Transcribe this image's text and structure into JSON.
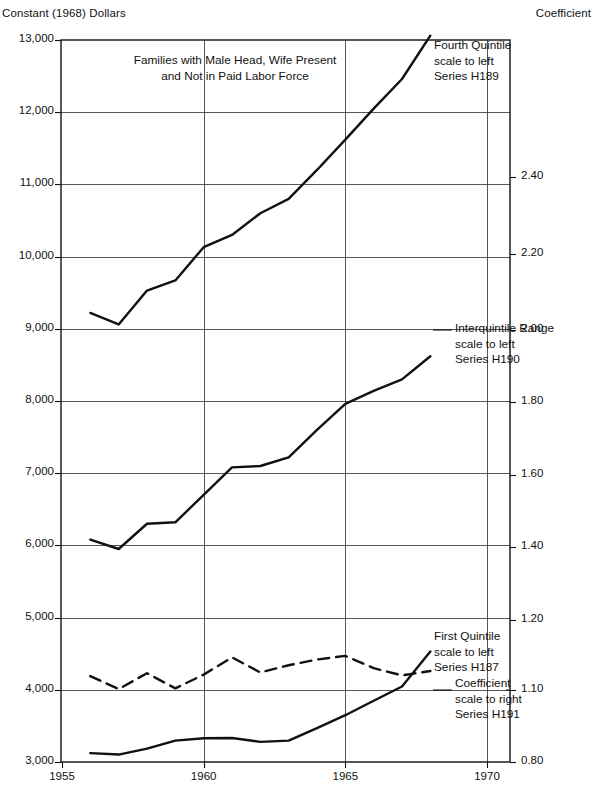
{
  "labels": {
    "left_unit": "Constant (1968) Dollars",
    "right_unit": "Coefficient",
    "plot_title_line1": "Families with Male Head, Wife Present",
    "plot_title_line2": "and Not in Paid Labor Force"
  },
  "annotations": {
    "fourth_quintile": {
      "line1": "Fourth Quintile",
      "line2": "scale to left",
      "line3": "Series H189"
    },
    "interquintile": {
      "line1": "Interquintile Range",
      "line2": "scale to left",
      "line3": "Series H190"
    },
    "first_quintile": {
      "line1": "First Quintile",
      "line2": "scale to left",
      "line3": "Series H187"
    },
    "coefficient": {
      "line1": "Coefficient",
      "line2": "scale to right",
      "line3": "Series H191"
    }
  },
  "chart_data": {
    "type": "line",
    "title": "Families with Male Head, Wife Present and Not in Paid Labor Force",
    "xlabel": "",
    "ylabel": "Constant (1968) Dollars",
    "y2label": "Coefficient",
    "xlim": [
      1955,
      1970.6
    ],
    "ylim": [
      3000,
      13000
    ],
    "y2lim": [
      0.8,
      2.6
    ],
    "grid": true,
    "legend_position": "inline-annotations",
    "xticks": [
      1955,
      1960,
      1965,
      1970
    ],
    "yticks": [
      3000,
      4000,
      5000,
      6000,
      7000,
      8000,
      9000,
      10000,
      11000,
      12000,
      13000
    ],
    "ytick_labels": [
      "3,000",
      "4,000",
      "5,000",
      "6,000",
      "7,000",
      "8,000",
      "9,000",
      "10,000",
      "11,000",
      "12,000",
      "13,000"
    ],
    "y2ticks": [
      0.8,
      1.1,
      1.2,
      1.4,
      1.6,
      1.8,
      2.0,
      2.2,
      2.4
    ],
    "y2tick_labels": [
      "0.80",
      "1.10",
      "1.20",
      "1.40",
      "1.60",
      "1.80",
      "2.00",
      "2.20",
      "2.40"
    ],
    "series": [
      {
        "name": "Fourth Quintile",
        "series_id": "H189",
        "scale": "left",
        "style": "solid",
        "color": "#111111",
        "x": [
          1956,
          1957,
          1958,
          1959,
          1960,
          1961,
          1962,
          1963,
          1964,
          1965,
          1966,
          1967,
          1968
        ],
        "values": [
          9220,
          9060,
          9530,
          9670,
          10130,
          10300,
          10600,
          10800,
          11200,
          11620,
          12050,
          12460,
          13060
        ]
      },
      {
        "name": "Interquintile Range",
        "series_id": "H190",
        "scale": "left",
        "style": "solid",
        "color": "#111111",
        "x": [
          1956,
          1957,
          1958,
          1959,
          1960,
          1961,
          1962,
          1963,
          1964,
          1965,
          1966,
          1967,
          1968
        ],
        "values": [
          6080,
          5950,
          6300,
          6320,
          6700,
          7080,
          7100,
          7220,
          7600,
          7960,
          8140,
          8300,
          8620
        ]
      },
      {
        "name": "First Quintile",
        "series_id": "H187",
        "scale": "left",
        "style": "dashed",
        "color": "#111111",
        "x": [
          1956,
          1957,
          1958,
          1959,
          1960,
          1961,
          1962,
          1963,
          1964,
          1965,
          1966,
          1967,
          1968
        ],
        "values": [
          4190,
          4010,
          4230,
          4020,
          4210,
          4450,
          4240,
          4340,
          4420,
          4470,
          4300,
          4200,
          4260
        ]
      },
      {
        "name": "Coefficient",
        "series_id": "H191",
        "scale": "right",
        "style": "solid",
        "color": "#111111",
        "x": [
          1956,
          1957,
          1958,
          1959,
          1960,
          1961,
          1962,
          1963,
          1964,
          1965,
          1966,
          1967,
          1968
        ],
        "values": [
          0.837,
          0.831,
          0.856,
          0.889,
          0.899,
          0.9,
          0.884,
          0.889,
          0.941,
          0.995,
          1.055,
          1.105,
          1.155
        ]
      }
    ]
  }
}
